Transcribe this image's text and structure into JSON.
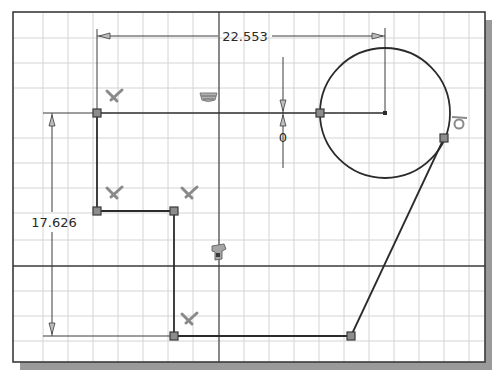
{
  "sketch": {
    "colors": {
      "background": "#ffffff",
      "grid": "#d4d4d4",
      "axis": "#3a3a3a",
      "geometry": "#2b2b2b",
      "dimension": "#3c3c3c",
      "point_fill": "#8c8c8c",
      "point_stroke": "#3a3a3a",
      "constraint_icon": "#8a8a8a",
      "frame": "#3a3a3a",
      "shadow": "#9a9a9a"
    },
    "dimensions": {
      "horizontal": "22.553",
      "vertical": "17.626",
      "offset": "0"
    },
    "constraints": [
      {
        "type": "perpendicular",
        "icon": "perpendicular-icon"
      },
      {
        "type": "perpendicular",
        "icon": "perpendicular-icon"
      },
      {
        "type": "perpendicular",
        "icon": "perpendicular-icon"
      },
      {
        "type": "perpendicular",
        "icon": "perpendicular-icon"
      },
      {
        "type": "horizontal",
        "icon": "horizontal-constraint-icon"
      },
      {
        "type": "coincident",
        "icon": "coincident-constraint-icon"
      },
      {
        "type": "tangent",
        "icon": "tangent-constraint-icon"
      }
    ]
  }
}
